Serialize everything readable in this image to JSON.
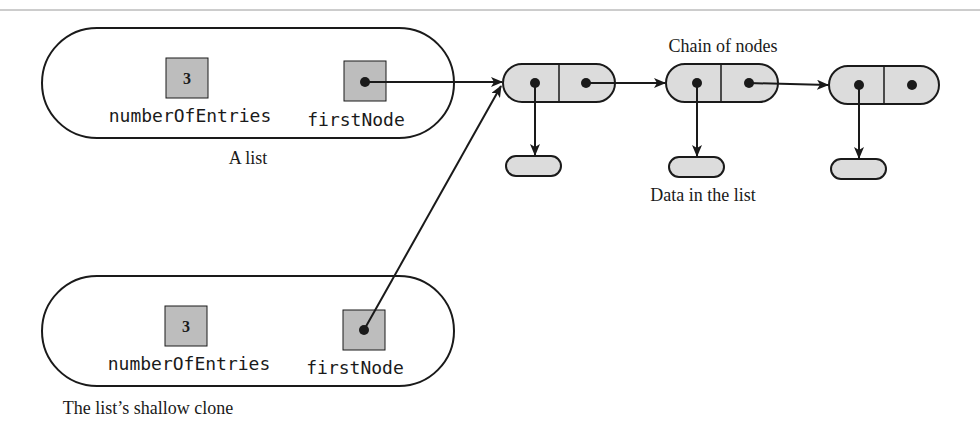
{
  "diagram": {
    "type": "linked-list-shallow-clone",
    "original_list": {
      "caption": "A list",
      "fields": [
        {
          "name": "numberOfEntries",
          "value": "3"
        },
        {
          "name": "firstNode",
          "value": "reference"
        }
      ]
    },
    "clone_list": {
      "caption": "The list’s shallow clone",
      "fields": [
        {
          "name": "numberOfEntries",
          "value": "3"
        },
        {
          "name": "firstNode",
          "value": "reference"
        }
      ]
    },
    "chain": {
      "caption": "Chain of nodes",
      "node_count": 3
    },
    "data_caption": "Data in the list",
    "colors": {
      "stroke": "#1a1a1a",
      "field_fill": "#bdbdbd",
      "node_fill": "#dcdcdc",
      "rule": "#9a9a9a"
    }
  }
}
